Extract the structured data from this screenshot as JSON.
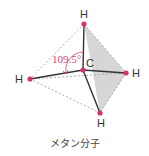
{
  "diagram": {
    "title": "メタン分子",
    "bond_angle_label": "109.5°",
    "atoms": {
      "center": {
        "label": "C"
      },
      "top": {
        "label": "H"
      },
      "right": {
        "label": "H"
      },
      "left": {
        "label": "H"
      },
      "bottom": {
        "label": "H"
      }
    },
    "colors": {
      "atom_dot": "#d6336c",
      "bond": "#333333",
      "edge_dashed": "#999999",
      "face_fill": "#cfcfcf",
      "angle": "#d4457a"
    }
  }
}
